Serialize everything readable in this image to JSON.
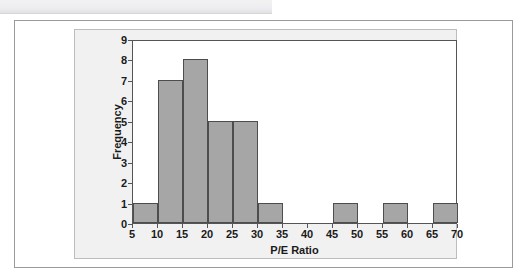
{
  "figure": {
    "background_color": "#ffffff",
    "panel_color": "#f1f1f1",
    "plot_color": "#ffffff",
    "bar_fill_color": "#a6a6a6",
    "bar_edge_color": "#4d4d4d",
    "axis_color": "#555555",
    "text_color": "#1a1a1a"
  },
  "chart_data": {
    "type": "bar",
    "title": "",
    "subtitle": "",
    "xlabel": "P/E Ratio",
    "ylabel": "Frequency",
    "xlim": [
      5,
      70
    ],
    "ylim": [
      0,
      9
    ],
    "grid": false,
    "legend": null,
    "bin_width": 5,
    "xticks": [
      5,
      10,
      15,
      20,
      25,
      30,
      35,
      40,
      45,
      50,
      55,
      60,
      65,
      70
    ],
    "xtick_labels": [
      "5",
      "10",
      "15",
      "20",
      "25",
      "30",
      "35",
      "40",
      "45",
      "50",
      "55",
      "60",
      "65",
      "70"
    ],
    "yticks": [
      0,
      1,
      2,
      3,
      4,
      5,
      6,
      7,
      8,
      9
    ],
    "ytick_labels": [
      "0",
      "1",
      "2",
      "3",
      "4",
      "5",
      "6",
      "7",
      "8",
      "9"
    ],
    "categories": [
      "5-10",
      "10-15",
      "15-20",
      "20-25",
      "25-30",
      "30-35",
      "35-40",
      "40-45",
      "45-50",
      "50-55",
      "55-60",
      "60-65",
      "65-70"
    ],
    "bin_edges": [
      5,
      10,
      15,
      20,
      25,
      30,
      35,
      40,
      45,
      50,
      55,
      60,
      65,
      70
    ],
    "values": [
      1,
      7,
      8,
      5,
      5,
      1,
      0,
      0,
      1,
      0,
      1,
      0,
      1
    ],
    "bars": [
      {
        "start": 5,
        "end": 10,
        "value": 1
      },
      {
        "start": 10,
        "end": 15,
        "value": 7
      },
      {
        "start": 15,
        "end": 20,
        "value": 8
      },
      {
        "start": 20,
        "end": 25,
        "value": 5
      },
      {
        "start": 25,
        "end": 30,
        "value": 5
      },
      {
        "start": 30,
        "end": 35,
        "value": 1
      },
      {
        "start": 35,
        "end": 40,
        "value": 0
      },
      {
        "start": 40,
        "end": 45,
        "value": 0
      },
      {
        "start": 45,
        "end": 50,
        "value": 1
      },
      {
        "start": 50,
        "end": 55,
        "value": 0
      },
      {
        "start": 55,
        "end": 60,
        "value": 1
      },
      {
        "start": 60,
        "end": 65,
        "value": 0
      },
      {
        "start": 65,
        "end": 70,
        "value": 1
      }
    ],
    "total_frequency": 30
  }
}
